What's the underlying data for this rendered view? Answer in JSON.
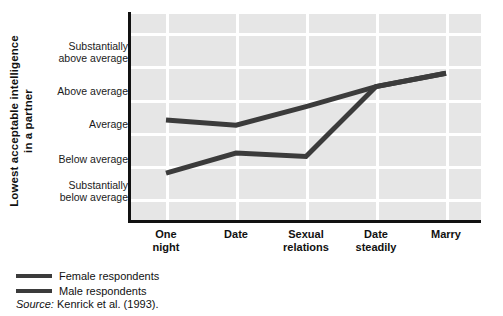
{
  "chart_data": {
    "type": "line",
    "title": "",
    "xlabel": "",
    "ylabel": "Lowest acceptable intelligence in a partner",
    "ylabel_lines": [
      "Lowest acceptable intelligence",
      "in a partner"
    ],
    "categories": [
      "One night",
      "Date",
      "Sexual relations",
      "Date steadily",
      "Marry"
    ],
    "category_lines": [
      [
        "One",
        "night"
      ],
      [
        "Date"
      ],
      [
        "Sexual",
        "relations"
      ],
      [
        "Date",
        "steadily"
      ],
      [
        "Marry"
      ]
    ],
    "ytick_labels": [
      "Substantially above average",
      "Above average",
      "Average",
      "Below average",
      "Substantially below average"
    ],
    "ytick_label_lines": [
      [
        "Substantially",
        "above average"
      ],
      [
        "Above average"
      ],
      [
        "Average"
      ],
      [
        "Below average"
      ],
      [
        "Substantially",
        "below average"
      ]
    ],
    "ylim": [
      -2,
      2
    ],
    "ytick_values": [
      2,
      1,
      0,
      -1,
      -2
    ],
    "grid": true,
    "legend_position": "below-left",
    "series": [
      {
        "name": "Female respondents",
        "color": "#3b3b3b",
        "values": [
          0.38,
          0.22,
          0.78,
          1.38,
          1.78
        ]
      },
      {
        "name": "Male respondents",
        "color": "#3b3b3b",
        "values": [
          -1.22,
          -0.62,
          -0.72,
          1.38,
          1.78
        ]
      }
    ],
    "annotations": [],
    "source": "Kenrick et al. (1993)."
  },
  "legend": {
    "items": [
      {
        "label": "Female respondents",
        "color": "#3b3b3b"
      },
      {
        "label": "Male respondents",
        "color": "#3b3b3b"
      }
    ]
  },
  "source_note": {
    "prefix": "Source:",
    "text": "Kenrick et al. (1993)."
  },
  "colors": {
    "plot_background": "#e6e6e6",
    "gridline": "#ffffff",
    "axis": "#111111",
    "line": "#3b3b3b"
  }
}
